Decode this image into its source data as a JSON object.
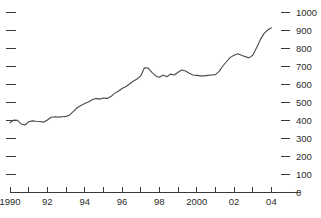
{
  "chart_data": {
    "type": "line",
    "title": "",
    "subtitle": "",
    "xlabel": "",
    "ylabel": "",
    "xlim": [
      1990,
      2004.3
    ],
    "ylim": [
      0,
      1000
    ],
    "grid": false,
    "legend": null,
    "y_axis": {
      "side": "right",
      "tick_values": [
        0,
        100,
        200,
        300,
        400,
        500,
        600,
        700,
        800,
        900,
        1000
      ],
      "tick_labels": [
        "0",
        "100",
        "200",
        "300",
        "400",
        "500",
        "600",
        "700",
        "800",
        "900",
        "1000"
      ],
      "mirror_ticks_left": true,
      "left_ticks_labeled": false
    },
    "x_axis": {
      "tick_values": [
        1990,
        1991,
        1992,
        1993,
        1994,
        1995,
        1996,
        1997,
        1998,
        1999,
        2000,
        2001,
        2002,
        2003,
        2004
      ],
      "labeled_ticks": [
        1990,
        1992,
        1994,
        1996,
        1998,
        2000,
        2002,
        2004
      ],
      "tick_labels": [
        "1990",
        "92",
        "94",
        "96",
        "98",
        "2000",
        "02",
        "04"
      ]
    },
    "series": [
      {
        "name": "series-1",
        "color": "#4a4a4a",
        "x": [
          1990.0,
          1990.2,
          1990.4,
          1990.6,
          1990.8,
          1991.0,
          1991.2,
          1991.4,
          1991.6,
          1991.8,
          1992.0,
          1992.2,
          1992.4,
          1992.6,
          1992.8,
          1993.0,
          1993.2,
          1993.4,
          1993.6,
          1993.8,
          1994.0,
          1994.2,
          1994.4,
          1994.6,
          1994.8,
          1995.0,
          1995.2,
          1995.4,
          1995.6,
          1995.8,
          1996.0,
          1996.2,
          1996.4,
          1996.6,
          1996.8,
          1997.0,
          1997.2,
          1997.4,
          1997.6,
          1997.8,
          1998.0,
          1998.2,
          1998.4,
          1998.6,
          1998.8,
          1999.0,
          1999.2,
          1999.4,
          1999.6,
          1999.8,
          2000.0,
          2000.2,
          2000.4,
          2000.6,
          2000.8,
          2001.0,
          2001.2,
          2001.4,
          2001.6,
          2001.8,
          2002.0,
          2002.2,
          2002.4,
          2002.6,
          2002.8,
          2003.0,
          2003.2,
          2003.4,
          2003.6,
          2003.8,
          2004.0
        ],
        "y": [
          385,
          400,
          398,
          378,
          372,
          390,
          395,
          393,
          392,
          388,
          400,
          415,
          418,
          416,
          418,
          420,
          428,
          448,
          468,
          480,
          492,
          500,
          512,
          520,
          516,
          522,
          520,
          530,
          548,
          560,
          575,
          585,
          600,
          615,
          628,
          645,
          690,
          688,
          665,
          645,
          638,
          650,
          640,
          655,
          650,
          665,
          678,
          672,
          660,
          650,
          648,
          645,
          645,
          648,
          650,
          652,
          670,
          700,
          725,
          748,
          760,
          768,
          760,
          752,
          745,
          760,
          800,
          845,
          880,
          900,
          912
        ],
        "units": "index"
      }
    ],
    "annotations": []
  },
  "chart_meta": {
    "background": "#ffffff",
    "axis_color": "#3a3a3a",
    "line_color": "#4a4a4a",
    "plot_left_px": 10,
    "plot_right_px": 277,
    "plot_top_px": 12,
    "plot_bottom_px": 192
  }
}
